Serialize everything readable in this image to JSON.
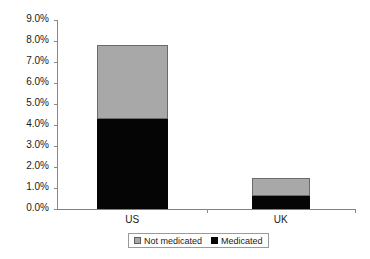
{
  "chart_data": {
    "type": "bar",
    "stacked": true,
    "title": "",
    "xlabel": "",
    "ylabel": "",
    "categories": [
      "US",
      "UK"
    ],
    "series": [
      {
        "name": "Medicated",
        "values": [
          4.3,
          0.6
        ],
        "color": "#050505"
      },
      {
        "name": "Not medicated",
        "values": [
          3.5,
          0.9
        ],
        "color": "#a8a8a8"
      }
    ],
    "totals": [
      7.8,
      1.5
    ],
    "ylim": [
      0.0,
      9.0
    ],
    "ytick_values": [
      0.0,
      1.0,
      2.0,
      3.0,
      4.0,
      5.0,
      6.0,
      7.0,
      8.0,
      9.0
    ],
    "ytick_labels": [
      "0.0%",
      "1.0%",
      "2.0%",
      "3.0%",
      "4.0%",
      "5.0%",
      "6.0%",
      "7.0%",
      "8.0%",
      "9.0%"
    ],
    "grid": false,
    "legend_position": "bottom",
    "legend_entries": [
      "Not medicated",
      "Medicated"
    ]
  },
  "axes": {
    "y": {
      "ticks": [
        {
          "label": "9.0%",
          "value": 9.0
        },
        {
          "label": "8.0%",
          "value": 8.0
        },
        {
          "label": "7.0%",
          "value": 7.0
        },
        {
          "label": "6.0%",
          "value": 6.0
        },
        {
          "label": "5.0%",
          "value": 5.0
        },
        {
          "label": "4.0%",
          "value": 4.0
        },
        {
          "label": "3.0%",
          "value": 3.0
        },
        {
          "label": "2.0%",
          "value": 2.0
        },
        {
          "label": "1.0%",
          "value": 1.0
        },
        {
          "label": "0.0%",
          "value": 0.0
        }
      ]
    },
    "x": {
      "ticks": [
        {
          "label": "US"
        },
        {
          "label": "UK"
        }
      ]
    }
  },
  "legend": {
    "items": [
      {
        "label": "Not medicated",
        "swatch": "gray"
      },
      {
        "label": "Medicated",
        "swatch": "black"
      }
    ]
  }
}
